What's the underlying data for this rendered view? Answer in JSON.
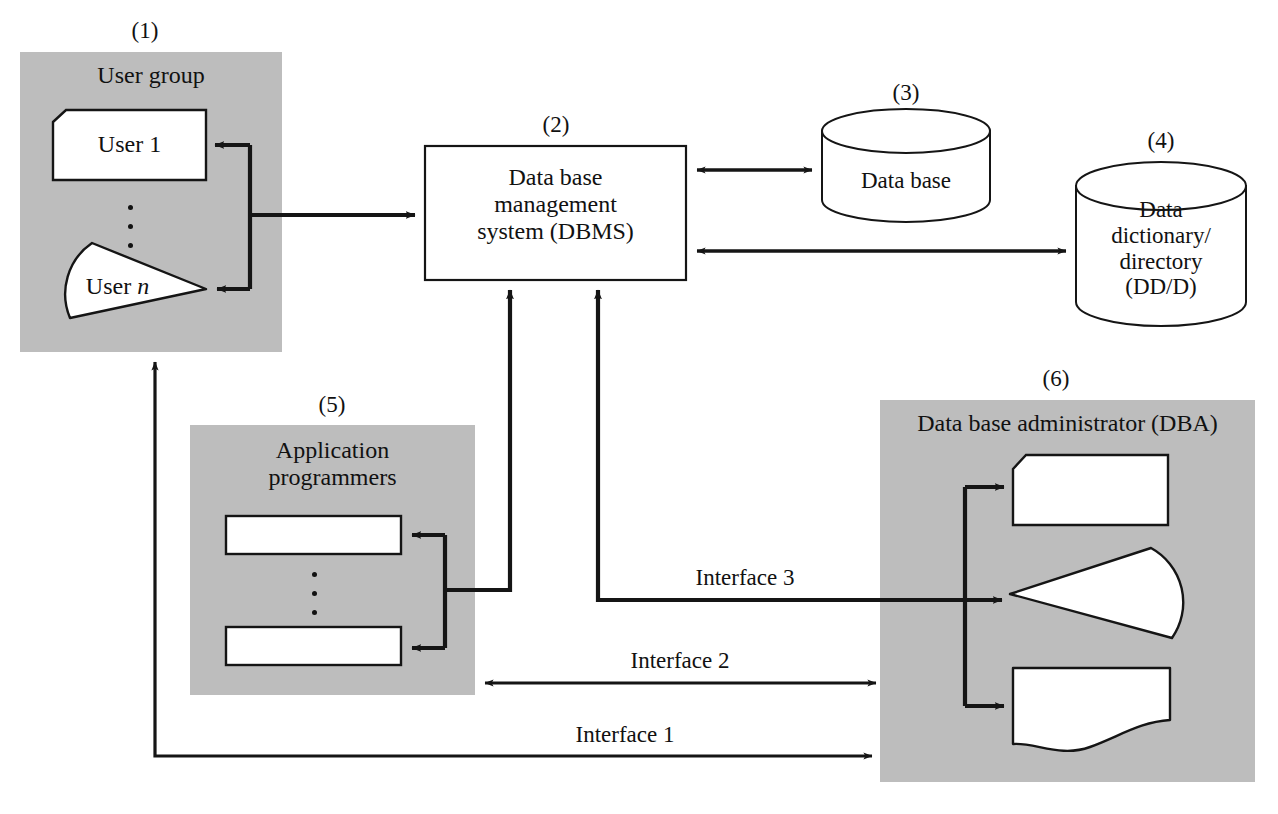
{
  "diagram": {
    "colors": {
      "panel_gray": "#bdbdbd",
      "stroke": "#151515",
      "white": "#ffffff",
      "background": "#ffffff"
    },
    "numbers": {
      "n1": "(1)",
      "n2": "(2)",
      "n3": "(3)",
      "n4": "(4)",
      "n5": "(5)",
      "n6": "(6)"
    },
    "nodes": {
      "user_group": {
        "title": "User group",
        "user_1": "User 1",
        "user_n_prefix": "User ",
        "user_n_italic": "n"
      },
      "dbms": {
        "line1": "Data base",
        "line2": "management",
        "line3": "system (DBMS)"
      },
      "database": {
        "label": "Data base"
      },
      "dictionary": {
        "line1": "Data",
        "line2": "dictionary/",
        "line3": "directory",
        "line4": "(DD/D)"
      },
      "application_programmers": {
        "line1": "Application",
        "line2": "programmers"
      },
      "dba": {
        "title": "Data base administrator (DBA)"
      }
    },
    "interfaces": {
      "if1": "Interface 1",
      "if2": "Interface 2",
      "if3": "Interface 3"
    }
  }
}
